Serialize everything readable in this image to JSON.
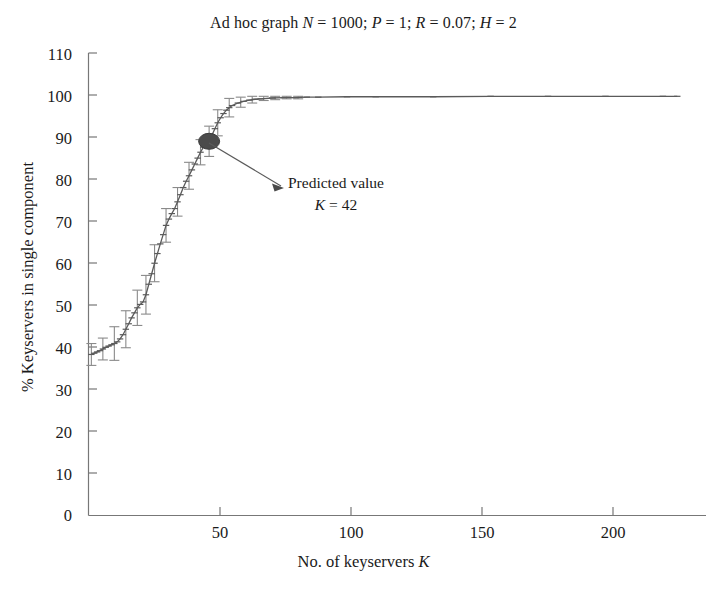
{
  "figure": {
    "background": "#ffffff",
    "line_color": "#5a5a5a",
    "marker_color": "#4a4a4a",
    "axis_color": "#6f6f6f",
    "text_color": "#1a1a1a"
  },
  "title": {
    "prefix": "Ad hoc graph ",
    "parts": [
      {
        "var": "N",
        "value": " = 1000; "
      },
      {
        "var": "P",
        "value": " = 1; "
      },
      {
        "var": "R",
        "value": " = 0.07; "
      },
      {
        "var": "H",
        "value": " = 2"
      }
    ],
    "full": "Ad hoc graph N = 1000; P = 1; R = 0.07; H = 2"
  },
  "axes": {
    "ylabel": "% Keyservers in single component",
    "xlabel_prefix": "No. of keyservers ",
    "xlabel_var": "K",
    "xlabel_full": "No. of keyservers K",
    "yticks": [
      0,
      10,
      20,
      30,
      40,
      50,
      60,
      70,
      80,
      90,
      100,
      110
    ],
    "xticks": [
      0,
      50,
      100,
      150,
      200
    ],
    "xtick_labels": [
      "",
      "50",
      "100",
      "150",
      "200"
    ],
    "ylim": [
      0,
      110
    ],
    "xlim": [
      0,
      215
    ],
    "grid": false
  },
  "annotation": {
    "line1": "Predicted value",
    "line2_var": "K",
    "line2_value": " = 42",
    "line2_full": "K = 42",
    "target_k": 42,
    "target_value": 89
  },
  "chart_data": {
    "type": "line",
    "title": "Ad hoc graph N = 1000; P = 1; R = 0.07; H = 2",
    "xlabel": "No. of keyservers K",
    "ylabel": "% Keyservers in single component",
    "xlim": [
      0,
      215
    ],
    "ylim": [
      0,
      110
    ],
    "grid": false,
    "legend": null,
    "series": [
      {
        "name": "% keyservers in single component",
        "x": [
          1,
          2,
          3,
          4,
          5,
          6,
          7,
          8,
          9,
          10,
          11,
          12,
          13,
          14,
          15,
          16,
          17,
          18,
          19,
          20,
          21,
          22,
          23,
          24,
          25,
          26,
          27,
          28,
          29,
          30,
          31,
          32,
          33,
          34,
          35,
          36,
          37,
          38,
          39,
          40,
          41,
          42,
          43,
          44,
          45,
          46,
          47,
          48,
          49,
          50,
          52,
          54,
          56,
          58,
          60,
          64,
          68,
          72,
          76,
          80,
          90,
          100,
          120,
          140,
          160,
          180,
          200,
          205
        ],
        "y": [
          38.3,
          38.6,
          38.9,
          39.2,
          39.6,
          40.0,
          40.3,
          40.6,
          40.9,
          41.3,
          42.0,
          43.0,
          44.3,
          45.6,
          47.0,
          48.2,
          49.4,
          50.2,
          50.8,
          52.5,
          55.0,
          57.5,
          60.0,
          62.3,
          64.6,
          66.8,
          69.0,
          70.5,
          71.8,
          73.0,
          74.6,
          76.3,
          78.0,
          79.5,
          80.8,
          82.2,
          83.6,
          85.0,
          86.4,
          87.6,
          88.3,
          89.0,
          90.5,
          92.0,
          93.4,
          94.6,
          95.6,
          96.4,
          97.0,
          97.5,
          98.1,
          98.5,
          98.8,
          99.0,
          99.1,
          99.3,
          99.4,
          99.4,
          99.5,
          99.5,
          99.6,
          99.6,
          99.6,
          99.7,
          99.7,
          99.7,
          99.7,
          99.7
        ],
        "errorbars_x": [
          1,
          5,
          9,
          13,
          17,
          20,
          23,
          27,
          31,
          35,
          39,
          42,
          45,
          49,
          53,
          57,
          61,
          65,
          69,
          73
        ],
        "errorbars_y": [
          38.3,
          39.6,
          40.9,
          44.3,
          49.4,
          52.5,
          60.0,
          69.0,
          74.6,
          80.8,
          86.4,
          89.0,
          93.4,
          97.0,
          98.3,
          98.9,
          99.2,
          99.3,
          99.4,
          99.4
        ],
        "errorbars_err": [
          2.6,
          2.6,
          4.0,
          4.4,
          4.2,
          4.6,
          4.4,
          4.0,
          3.4,
          3.2,
          3.0,
          3.6,
          3.1,
          2.2,
          1.2,
          0.8,
          0.5,
          0.4,
          0.3,
          0.3
        ]
      }
    ],
    "highlight_point": {
      "x": 42,
      "y": 89,
      "label": "Predicted value K = 42"
    }
  }
}
